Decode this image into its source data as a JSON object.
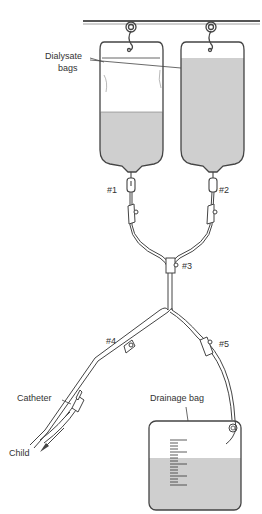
{
  "diagram": {
    "labels": {
      "dialysate_bags": [
        "Dialysate",
        "bags"
      ],
      "clamp1": "#1",
      "clamp2": "#2",
      "clamp3": "#3",
      "clamp4": "#4",
      "clamp5": "#5",
      "catheter": "Catheter",
      "drainage_bag": "Drainage bag",
      "child": "Child"
    },
    "colors": {
      "line": "#444444",
      "fluid": "#cfcfcf",
      "background": "#ffffff"
    }
  }
}
